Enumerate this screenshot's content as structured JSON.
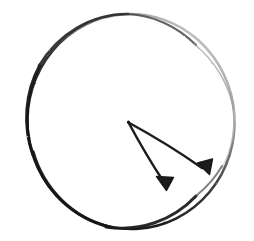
{
  "figure": {
    "title": "Hand-drawn circle with two arrows from a common vertex",
    "medium": "pencil-sketch",
    "background_color": "#ffffff",
    "canvas": {
      "width": 254,
      "height": 241
    }
  },
  "diagram_data": {
    "type": "sketch",
    "shapes": [
      {
        "id": "circle-outline",
        "name": "circle",
        "role": "boundary",
        "center": {
          "x": 131,
          "y": 121.5
        },
        "radius_x": 103.5,
        "radius_y": 107.5,
        "rotation_deg": -4,
        "stroke_color": "#1c1c1c",
        "stroke_color_faded": "#b9b9b9",
        "stroke_width_max": 3.4,
        "stroke_width_min": 0.9,
        "note": "Dark and heavy along the left and bottom arcs, fading to pale gray along the upper-right arc"
      },
      {
        "id": "arrow-lower-left",
        "name": "arrow",
        "role": "vector",
        "from": {
          "x": 128,
          "y": 122
        },
        "to": {
          "x": 166,
          "y": 190
        },
        "angle_deg": 60.8,
        "length_px": 77.9,
        "stroke_color": "#1f1f1f",
        "stroke_width": 2.6,
        "head": {
          "length": 15,
          "half_width": 8,
          "filled": true
        }
      },
      {
        "id": "arrow-lower-right",
        "name": "arrow",
        "role": "vector",
        "from": {
          "x": 128,
          "y": 122
        },
        "to": {
          "x": 209,
          "y": 174
        },
        "angle_deg": 32.7,
        "length_px": 96.3,
        "stroke_color": "#1f1f1f",
        "stroke_width": 2.6,
        "head": {
          "length": 16,
          "half_width": 9,
          "filled": true
        }
      }
    ],
    "vertex": {
      "id": "common-origin",
      "label": "",
      "x": 128,
      "y": 122,
      "description": "Shared tail point of both arrows, near the circle center"
    },
    "labels": [],
    "annotations": [],
    "legend": []
  },
  "colors": {
    "ink_dark": "#1c1c1c",
    "ink_mid": "#4a4a4a",
    "ink_faded": "#b9b9b9",
    "paper": "#ffffff"
  }
}
